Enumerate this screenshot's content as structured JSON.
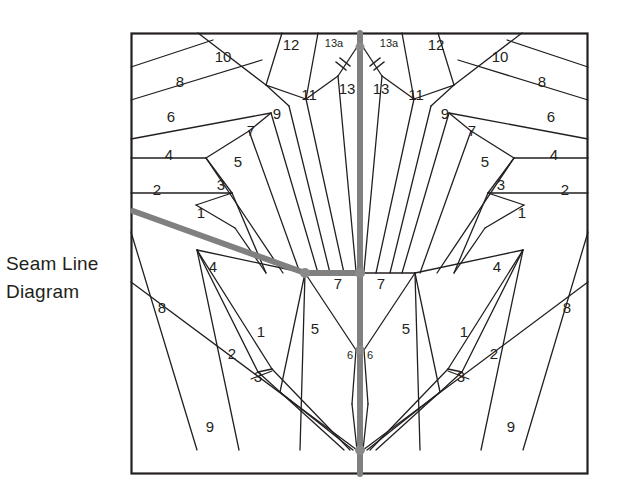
{
  "caption": {
    "line1": "Seam Line",
    "line2": "Diagram"
  },
  "colors": {
    "ink": "#231f20",
    "seam_highlight": "#808080",
    "background": "#ffffff",
    "border": "#231f20"
  },
  "frame": {
    "x": 131,
    "y": 33,
    "width": 457,
    "height": 441
  },
  "piece_labels": {
    "top_left": [
      {
        "id": "tl-12",
        "text": "12",
        "x": 291,
        "y": 50
      },
      {
        "id": "tl-13a",
        "text": "13a",
        "x": 334,
        "y": 47,
        "size": "small"
      },
      {
        "id": "tl-13",
        "text": "13",
        "x": 347,
        "y": 94
      },
      {
        "id": "tl-11",
        "text": "11",
        "x": 309,
        "y": 100
      },
      {
        "id": "tl-10",
        "text": "10",
        "x": 223,
        "y": 62
      },
      {
        "id": "tl-9",
        "text": "9",
        "x": 277,
        "y": 119
      },
      {
        "id": "tl-8",
        "text": "8",
        "x": 180,
        "y": 87
      },
      {
        "id": "tl-7",
        "text": "7",
        "x": 251,
        "y": 136
      },
      {
        "id": "tl-6",
        "text": "6",
        "x": 171,
        "y": 122
      },
      {
        "id": "tl-5",
        "text": "5",
        "x": 238,
        "y": 167
      },
      {
        "id": "tl-4",
        "text": "4",
        "x": 169,
        "y": 160
      },
      {
        "id": "tl-3",
        "text": "3",
        "x": 221,
        "y": 190
      },
      {
        "id": "tl-2",
        "text": "2",
        "x": 157,
        "y": 195
      },
      {
        "id": "tl-1",
        "text": "1",
        "x": 201,
        "y": 218
      }
    ],
    "top_right": [
      {
        "id": "tr-12",
        "text": "12",
        "x": 436,
        "y": 50
      },
      {
        "id": "tr-13a",
        "text": "13a",
        "x": 389,
        "y": 47,
        "size": "small"
      },
      {
        "id": "tr-13",
        "text": "13",
        "x": 381,
        "y": 94
      },
      {
        "id": "tr-11",
        "text": "11",
        "x": 416,
        "y": 100
      },
      {
        "id": "tr-10",
        "text": "10",
        "x": 500,
        "y": 62
      },
      {
        "id": "tr-9",
        "text": "9",
        "x": 445,
        "y": 119
      },
      {
        "id": "tr-8",
        "text": "8",
        "x": 542,
        "y": 87
      },
      {
        "id": "tr-7",
        "text": "7",
        "x": 472,
        "y": 136
      },
      {
        "id": "tr-6",
        "text": "6",
        "x": 551,
        "y": 122
      },
      {
        "id": "tr-5",
        "text": "5",
        "x": 485,
        "y": 167
      },
      {
        "id": "tr-4",
        "text": "4",
        "x": 554,
        "y": 160
      },
      {
        "id": "tr-3",
        "text": "3",
        "x": 501,
        "y": 190
      },
      {
        "id": "tr-2",
        "text": "2",
        "x": 565,
        "y": 195
      },
      {
        "id": "tr-1",
        "text": "1",
        "x": 522,
        "y": 218
      }
    ],
    "bottom_left": [
      {
        "id": "bl-4",
        "text": "4",
        "x": 213,
        "y": 272
      },
      {
        "id": "bl-7",
        "text": "7",
        "x": 338,
        "y": 289
      },
      {
        "id": "bl-5",
        "text": "5",
        "x": 315,
        "y": 334
      },
      {
        "id": "bl-6",
        "text": "6",
        "x": 350,
        "y": 359,
        "size": "small"
      },
      {
        "id": "bl-8",
        "text": "8",
        "x": 162,
        "y": 313
      },
      {
        "id": "bl-1",
        "text": "1",
        "x": 261,
        "y": 337
      },
      {
        "id": "bl-2",
        "text": "2",
        "x": 232,
        "y": 359
      },
      {
        "id": "bl-3",
        "text": "3",
        "x": 258,
        "y": 382
      },
      {
        "id": "bl-9",
        "text": "9",
        "x": 210,
        "y": 432
      }
    ],
    "bottom_right": [
      {
        "id": "br-4",
        "text": "4",
        "x": 497,
        "y": 272
      },
      {
        "id": "br-7",
        "text": "7",
        "x": 381,
        "y": 289
      },
      {
        "id": "br-5",
        "text": "5",
        "x": 406,
        "y": 334
      },
      {
        "id": "br-6",
        "text": "6",
        "x": 370,
        "y": 359,
        "size": "small"
      },
      {
        "id": "br-8",
        "text": "8",
        "x": 567,
        "y": 313
      },
      {
        "id": "br-1",
        "text": "1",
        "x": 464,
        "y": 337
      },
      {
        "id": "br-2",
        "text": "2",
        "x": 494,
        "y": 359
      },
      {
        "id": "br-3",
        "text": "3",
        "x": 461,
        "y": 382
      },
      {
        "id": "br-9",
        "text": "9",
        "x": 511,
        "y": 432
      }
    ]
  },
  "notch_marks": {
    "count": 4,
    "description": "double tick marks across the 13 seam lines"
  }
}
